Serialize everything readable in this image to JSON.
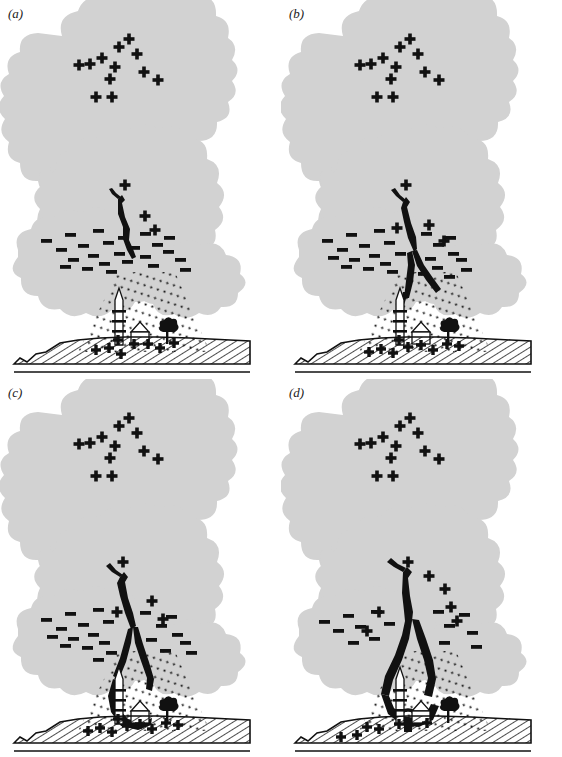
{
  "figure": {
    "panel_count": 4,
    "background_color": "#ffffff",
    "cloud_color": "#d2d2d2",
    "ink_color": "#000000"
  },
  "legend_symbols": {
    "positive_charge": "+",
    "negative_charge": "—",
    "precipitation": "dotted-diagonal-streaks",
    "ground_fill": "diagonal-hatching"
  },
  "panels": [
    {
      "id": "a",
      "label": "(a)",
      "stage_name": "stepped-leader-initiation",
      "leader_length_fraction": 0.18,
      "leader_branched": false,
      "leader_reaches_ground": false,
      "upward_streamers": false,
      "return_stroke": false,
      "cloud_positive_charges": 13,
      "cloud_negative_charges": 24,
      "ground_positive_charges": 8,
      "ground_objects": [
        "tower",
        "house",
        "tree"
      ]
    },
    {
      "id": "b",
      "label": "(b)",
      "stage_name": "stepped-leader-descending",
      "leader_length_fraction": 0.45,
      "leader_branched": true,
      "leader_reaches_ground": false,
      "upward_streamers": false,
      "return_stroke": false,
      "cloud_positive_charges": 13,
      "cloud_negative_charges": 24,
      "ground_positive_charges": 9,
      "ground_objects": [
        "tower",
        "house",
        "tree"
      ]
    },
    {
      "id": "c",
      "label": "(c)",
      "stage_name": "leader-approaching-ground",
      "leader_length_fraction": 0.78,
      "leader_branched": true,
      "leader_reaches_ground": false,
      "upward_streamers": true,
      "return_stroke": false,
      "cloud_positive_charges": 13,
      "cloud_negative_charges": 22,
      "ground_positive_charges": 9,
      "ground_objects": [
        "tower",
        "house",
        "tree"
      ]
    },
    {
      "id": "d",
      "label": "(d)",
      "stage_name": "return-stroke-attachment",
      "leader_length_fraction": 1.0,
      "leader_branched": true,
      "leader_reaches_ground": true,
      "upward_streamers": false,
      "return_stroke": true,
      "cloud_positive_charges": 12,
      "cloud_negative_charges": 14,
      "ground_positive_charges": 6,
      "ground_objects": [
        "tower",
        "house",
        "tree"
      ]
    }
  ]
}
